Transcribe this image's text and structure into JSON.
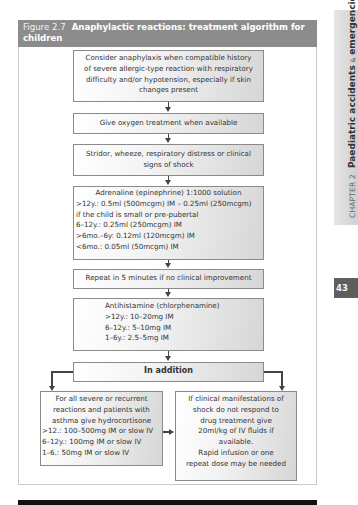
{
  "figure": {
    "number": "Figure 2.7",
    "title": "Anaphylactic reactions: treatment algorithm for children"
  },
  "steps": [
    {
      "id": "consider",
      "lines": [
        "Consider anaphylaxis when compatible history",
        "of severe allergic-type reaction with respiratory",
        "difficulty and/or hypotension, especially if skin",
        "changes present"
      ]
    },
    {
      "id": "oxygen",
      "lines": [
        "Give oxygen treatment when available"
      ]
    },
    {
      "id": "signs",
      "lines": [
        "Stridor, wheeze, respiratory distress or clinical",
        "signs of shock"
      ]
    },
    {
      "id": "adrenaline",
      "lines": [
        "Adrenaline (epinephrine) 1:1000 solution",
        ">12y.: 0.5ml (500mcgm) IM – 0.25ml (250mcgm)",
        "if the child is small or pre-pubertal",
        "6–12y.: 0.25ml (250mcgm) IM",
        ">6mo.–6y: 0.12ml (120mcgm) IM",
        "<6mo.: 0.05ml (50mcgm) IM"
      ]
    },
    {
      "id": "repeat",
      "lines": [
        "Repeat in 5 minutes if no clinical improvement"
      ]
    },
    {
      "id": "antihistamine",
      "lines": [
        "Antihistamine (chlorphenamine)",
        ">12y.: 10–20mg IM",
        "6–12y.: 5–10mg IM",
        "1–6y.: 2.5–5mg IM"
      ]
    },
    {
      "id": "in_addition",
      "lines": [
        "In addition"
      ]
    }
  ],
  "branches": {
    "left": {
      "lines": [
        "For all severe or recurrent",
        "reactions and patients with",
        "asthma give hydrocortisone",
        ">12.: 100–500mg IM or slow IV",
        "6–12y.: 100mg IM or slow IV",
        "1–6.: 50mg IM or slow IV"
      ]
    },
    "right": {
      "lines": [
        "If clinical manifestations of",
        "shock do not respond to",
        "drug treatment give",
        "20ml/kg of IV fluids if",
        "available.",
        "Rapid infusion or one",
        "repeat dose may be needed"
      ]
    }
  },
  "side_tab": {
    "chapter": "CHAPTER 2",
    "title_part1": "Paediatric accidents",
    "amp": "&",
    "title_part2": "emergencies"
  },
  "page_number": "43",
  "colors": {
    "header_bg": "#8c8c8c",
    "box_border": "#8a8a8a",
    "page_num_bg": "#5e5e5e",
    "bottom_bar": "#111111"
  }
}
